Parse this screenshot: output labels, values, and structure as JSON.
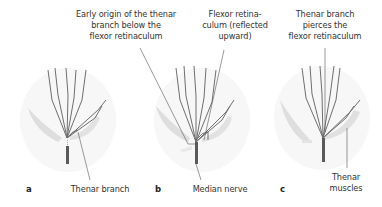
{
  "figure": {
    "colors": {
      "nerve": "#6e6e6e",
      "muscle": "#dcdcdc",
      "leader_line": "#555555",
      "text": "#333333",
      "background": "#ffffff"
    },
    "panels": [
      {
        "letter": "a",
        "top_label": [
          "Early origin of the thenar",
          "branch below the",
          "flexor retinaculum"
        ],
        "bottom_label": [
          "Thenar branch"
        ]
      },
      {
        "letter": "b",
        "top_label": [
          "Flexor retina-",
          "culum (reflected",
          "upward)"
        ],
        "bottom_label": [
          "Median nerve"
        ]
      },
      {
        "letter": "c",
        "top_label": [
          "Thenar branch",
          "pierces the",
          "flexor retinaculum"
        ],
        "bottom_label": [
          "Thenar",
          "muscles"
        ]
      }
    ]
  }
}
